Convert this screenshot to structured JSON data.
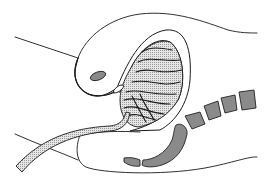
{
  "figure": {
    "type": "anatomical line illustration",
    "view": "sagittal section",
    "parts": [
      {
        "id": "upper-body-outline",
        "label": "upper body contour"
      },
      {
        "id": "oval-opening",
        "label": "small oval opening"
      },
      {
        "id": "sac-wall",
        "label": "curved sac wall"
      },
      {
        "id": "coiled-loops",
        "label": "coiled folded loops"
      },
      {
        "id": "tube",
        "label": "long tube"
      },
      {
        "id": "vertebrae",
        "label": "vertebral segments"
      },
      {
        "id": "sacrum-coccyx",
        "label": "sacrum and coccyx"
      },
      {
        "id": "lower-body-outline",
        "label": "lower body contour"
      }
    ],
    "vertebra_count": 4
  },
  "colors": {
    "background": "#ffffff",
    "stroke": "#1a1a1a",
    "bone_fill": "#8a8a8a",
    "hatch_dot": "#9a9a9a"
  }
}
